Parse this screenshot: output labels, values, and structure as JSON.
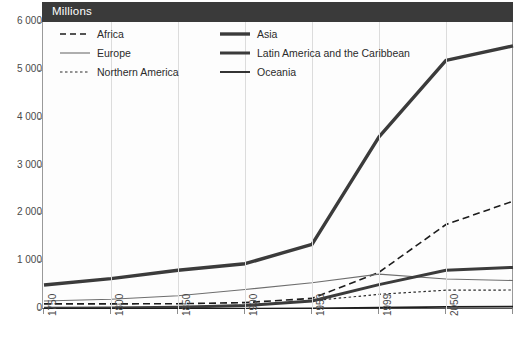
{
  "header": {
    "label": "Millions"
  },
  "legend": {
    "entries": [
      {
        "name": "Africa",
        "style": "dashed",
        "width": 1.6,
        "color": "#1d1d1d"
      },
      {
        "name": "Europe",
        "style": "solid",
        "width": 1.1,
        "color": "#6e6e6e"
      },
      {
        "name": "Northern America",
        "style": "dotted",
        "width": 1.2,
        "color": "#2b2b2b"
      },
      {
        "name": "Asia",
        "style": "solid",
        "width": 3.4,
        "color": "#3b3b3b"
      },
      {
        "name": "Latin America and the Caribbean",
        "style": "solid",
        "width": 3.0,
        "color": "#3b3b3b"
      },
      {
        "name": "Oceania",
        "style": "solid",
        "width": 1.8,
        "color": "#1d1d1d"
      }
    ]
  },
  "chart_data": {
    "type": "line",
    "title": "Millions",
    "xlabel": "",
    "ylabel": "Millions",
    "ylim": [
      0,
      6000
    ],
    "ytick_values": [
      0,
      1000,
      2000,
      3000,
      4000,
      5000,
      6000
    ],
    "ytick_labels": [
      "0",
      "1 000",
      "2 000",
      "3 000",
      "4 000",
      "5 000",
      "6 000"
    ],
    "grid": "vertical-only",
    "legend_position": "top-left-inside",
    "categories": [
      "1750",
      "1800",
      "1850",
      "1900",
      "1950",
      "1999",
      "2050",
      "2150"
    ],
    "series": [
      {
        "name": "Africa",
        "values": [
          106,
          107,
          111,
          133,
          221,
          767,
          1766,
          2254
        ]
      },
      {
        "name": "Europe",
        "values": [
          167,
          203,
          276,
          408,
          547,
          729,
          628,
          595
        ]
      },
      {
        "name": "Northern America",
        "values": [
          2,
          7,
          26,
          82,
          172,
          307,
          392,
          398
        ]
      },
      {
        "name": "Asia",
        "values": [
          502,
          635,
          809,
          947,
          1350,
          3600,
          5200,
          5500
        ]
      },
      {
        "name": "Latin America and the Caribbean",
        "values": [
          16,
          24,
          38,
          74,
          167,
          511,
          809,
          870
        ]
      },
      {
        "name": "Oceania",
        "values": [
          2,
          2,
          2,
          6,
          13,
          30,
          46,
          51
        ]
      }
    ]
  }
}
